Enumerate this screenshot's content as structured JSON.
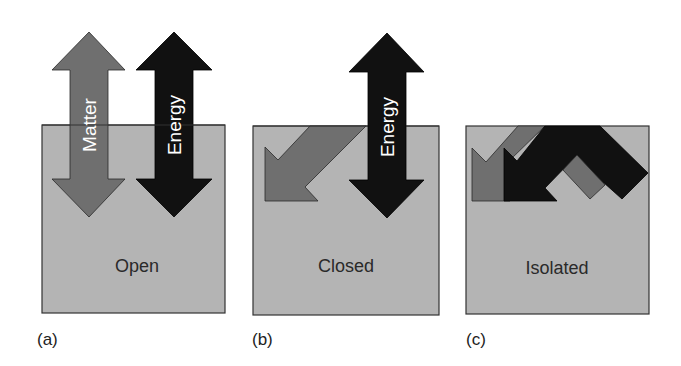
{
  "figure": {
    "panels": [
      {
        "id": "a",
        "label": "(a)",
        "system": "Open",
        "arrows": [
          "Matter",
          "Energy"
        ]
      },
      {
        "id": "b",
        "label": "(b)",
        "system": "Closed",
        "arrows": [
          "Energy"
        ]
      },
      {
        "id": "c",
        "label": "(c)",
        "system": "Isolated",
        "arrows": []
      }
    ],
    "arrow_labels": {
      "matter": "Matter",
      "energy": "Energy"
    },
    "colors": {
      "box": "#b4b4b4",
      "matter": "#6f6f6f",
      "energy": "#111111",
      "border": "#333333"
    }
  }
}
